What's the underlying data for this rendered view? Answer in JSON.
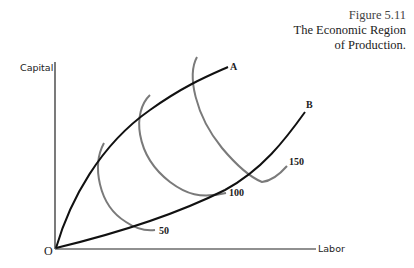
{
  "caption": {
    "figure_number": "Figure 5.11",
    "title_line1": "The Economic Region",
    "title_line2": "of Production."
  },
  "axes": {
    "y_label": "Capital",
    "x_label": "Labor",
    "origin_label": "O"
  },
  "ridge_lines": [
    {
      "label": "A",
      "color": "#111111"
    },
    {
      "label": "B",
      "color": "#111111"
    }
  ],
  "isoquants": [
    {
      "label": "50",
      "color": "#777777"
    },
    {
      "label": "100",
      "color": "#777777"
    },
    {
      "label": "150",
      "color": "#777777"
    }
  ],
  "colors": {
    "axis": "#222222",
    "ridge": "#111111",
    "isoquant": "#7a7a7a",
    "background": "#ffffff"
  }
}
